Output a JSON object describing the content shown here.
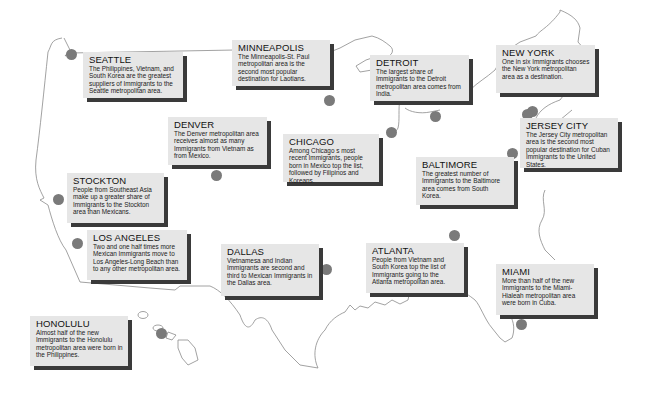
{
  "map": {
    "subject": "Immigrant destinations in US metropolitan areas",
    "colors": {
      "card_bg": "#e6e6e6",
      "card_shadow": "#3a3a3a",
      "dot": "#7a7a7a",
      "outline": "#888888"
    }
  },
  "cities": [
    {
      "name": "SEATTLE",
      "text": "The Philippines, Vietnam, and South Korea are the greatest suppliers of Immigrants to the Seattle metropolitan area."
    },
    {
      "name": "MINNEAPOLIS",
      "text": "The Minneapolis-St. Paul metropolitan area is the second most popular destination for Laotians."
    },
    {
      "name": "DETROIT",
      "text": "The largest share of Immigrants to the Detroit metropolitan area comes from India."
    },
    {
      "name": "NEW YORK",
      "text": "One in six Immigrants chooses the New York metropolitan area as a destination."
    },
    {
      "name": "DENVER",
      "text": "The Denver metropolitan area receives almost as many Immigrants from Vietnam as from Mexico."
    },
    {
      "name": "CHICAGO",
      "text": "Among Chicago s most recent Immigrants, people born in Mexico top the list, followed by Filipinos and Koreans."
    },
    {
      "name": "JERSEY CITY",
      "text": "The Jersey City metropolitan area is the second most popular destination for Cuban Immigrants to the United States."
    },
    {
      "name": "BALTIMORE",
      "text": "The greatest number of Immigrants to the Baltimore area comes from South Korea."
    },
    {
      "name": "STOCKTON",
      "text": "People from Southeast Asia make up a greater share of Immigrants to the Stockton area than Mexicans."
    },
    {
      "name": "LOS ANGELES",
      "text": "Two and one half times more Mexican Immigrants move to Los Angeles-Long Beach than to any other metropolitan area."
    },
    {
      "name": "DALLAS",
      "text": "Vietnamesa and Indian Immigrants are second and third to Mexican Immigrants in the Dallas area."
    },
    {
      "name": "ATLANTA",
      "text": "People from Vietnam and South Korea top the list of Immigrants going to the Atlanta metropolitan area."
    },
    {
      "name": "MIAMI",
      "text": "More than half of the new Immigrants to the Miami-Hialeah metropolitan area were born in Cuba."
    },
    {
      "name": "HONOLULU",
      "text": "Almost half of the new Immigrants to the Honolulu metropolitan area were born in the Philippines."
    }
  ]
}
